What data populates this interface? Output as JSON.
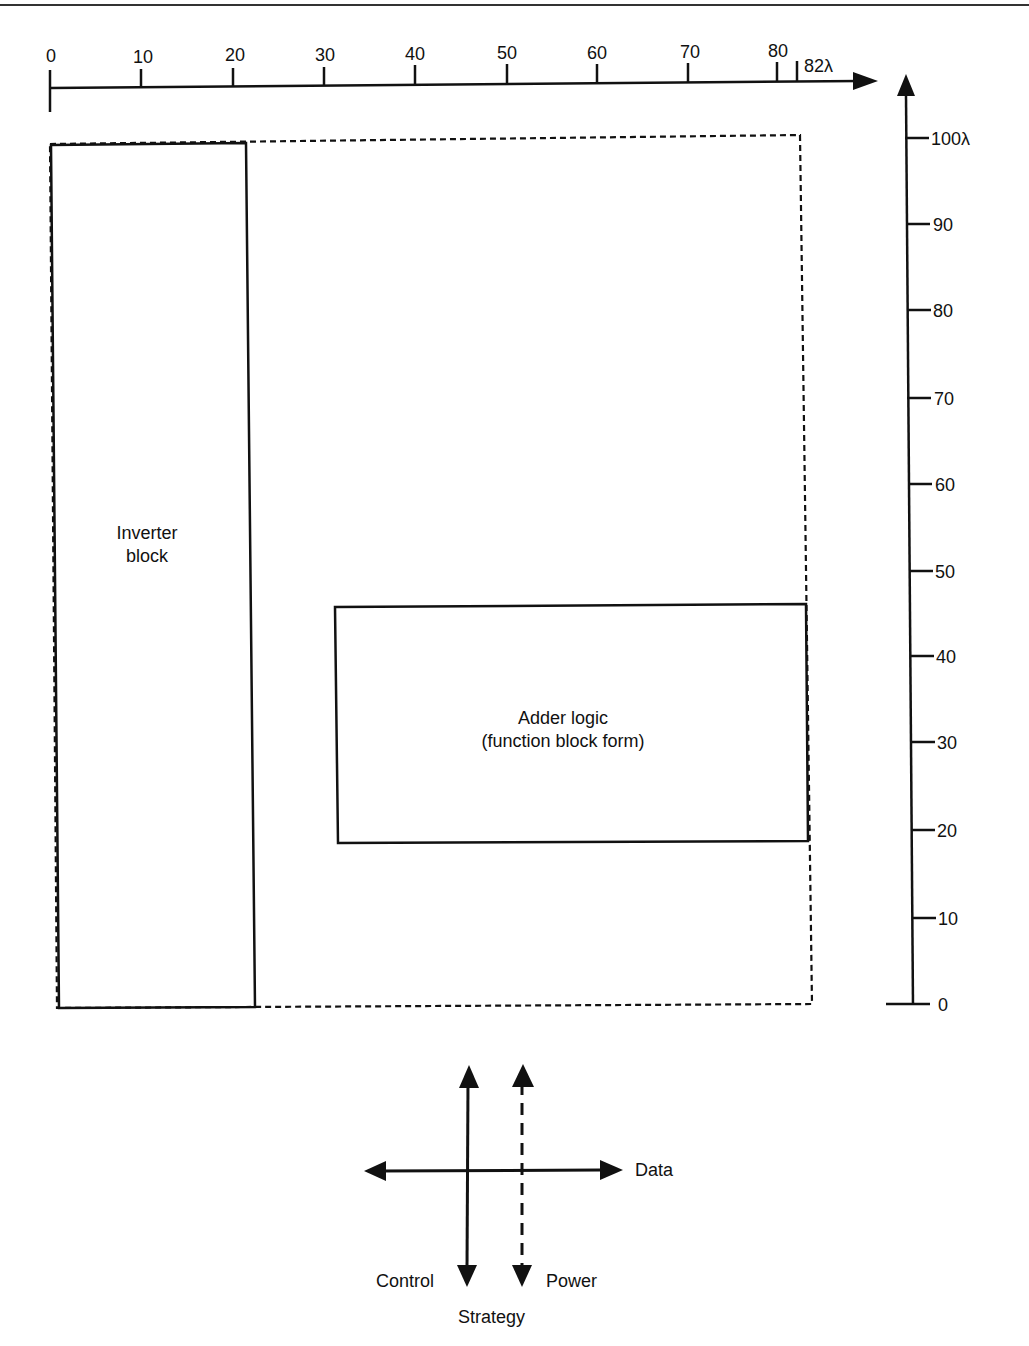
{
  "figure": {
    "x_axis": {
      "unit": "λ",
      "ticks": [
        "0",
        "10",
        "20",
        "30",
        "40",
        "50",
        "60",
        "70",
        "80"
      ],
      "end_label": "82λ"
    },
    "y_axis": {
      "ticks": [
        "0",
        "10",
        "20",
        "30",
        "40",
        "50",
        "60",
        "70",
        "80",
        "90"
      ],
      "end_label": "100λ"
    },
    "blocks": {
      "inverter": {
        "line1": "Inverter",
        "line2": "block"
      },
      "adder": {
        "line1": "Adder logic",
        "line2": "(function block form)"
      }
    },
    "strategy": {
      "data_label": "Data",
      "control_label": "Control",
      "power_label": "Power",
      "title": "Strategy"
    }
  }
}
